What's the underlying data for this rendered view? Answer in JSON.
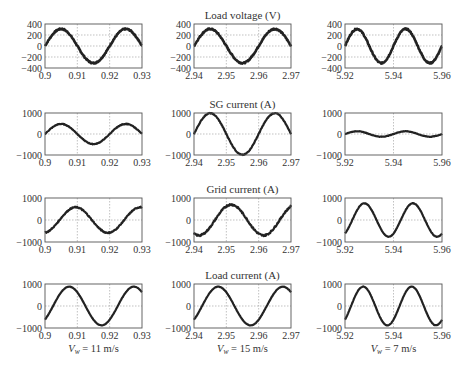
{
  "chart_data": {
    "type": "line",
    "layout": "4x3 grid of subplots",
    "grid": true,
    "columns": [
      {
        "caption_var": "V",
        "caption_sub": "w",
        "caption_value": "= 11 m/s",
        "xlim": [
          0.9,
          0.93
        ],
        "xticks": [
          "0.9",
          "0.91",
          "0.92",
          "0.93"
        ]
      },
      {
        "caption_var": "V",
        "caption_sub": "w",
        "caption_value": "= 15 m/s",
        "xlim": [
          2.94,
          2.97
        ],
        "xticks": [
          "2.94",
          "2.95",
          "2.96",
          "2.97"
        ]
      },
      {
        "caption_var": "V",
        "caption_sub": "w",
        "caption_value": "= 7 m/s",
        "xlim": [
          5.92,
          5.96
        ],
        "xticks": [
          "5.92",
          "5.94",
          "5.96"
        ]
      }
    ],
    "rows": [
      {
        "title": "Load voltage (V)",
        "ylim": [
          -400,
          400
        ],
        "yticks": [
          "400",
          "200",
          "0",
          "−200",
          "−400"
        ]
      },
      {
        "title": "SG current (A)",
        "ylim": [
          -1000,
          1000
        ],
        "yticks": [
          "1000",
          "0",
          "−1000"
        ]
      },
      {
        "title": "Grid current (A)",
        "ylim": [
          -1000,
          1000
        ],
        "yticks": [
          "1000",
          "0",
          "−1000"
        ]
      },
      {
        "title": "Load current (A)",
        "ylim": [
          -1000,
          1000
        ],
        "yticks": [
          "1000",
          "0",
          "−1000"
        ]
      }
    ],
    "series": [
      {
        "row": 0,
        "col": 0,
        "name": "Load voltage, Vw=11",
        "frequency_hz": 50,
        "amplitude": 310,
        "peak_time": 0.905,
        "noise": 12
      },
      {
        "row": 0,
        "col": 1,
        "name": "Load voltage, Vw=15",
        "frequency_hz": 50,
        "amplitude": 310,
        "peak_time": 2.945,
        "noise": 12
      },
      {
        "row": 0,
        "col": 2,
        "name": "Load voltage, Vw=7",
        "frequency_hz": 50,
        "amplitude": 310,
        "peak_time": 5.925,
        "noise": 12
      },
      {
        "row": 1,
        "col": 0,
        "name": "SG current, Vw=11",
        "frequency_hz": 50,
        "amplitude": 480,
        "peak_time": 0.905,
        "noise": 15
      },
      {
        "row": 1,
        "col": 1,
        "name": "SG current, Vw=15",
        "frequency_hz": 50,
        "amplitude": 990,
        "peak_time": 2.945,
        "noise": 20
      },
      {
        "row": 1,
        "col": 2,
        "name": "SG current, Vw=7",
        "frequency_hz": 50,
        "amplitude": 130,
        "peak_time": 5.925,
        "noise": 10
      },
      {
        "row": 2,
        "col": 0,
        "name": "Grid current, Vw=11",
        "frequency_hz": 50,
        "amplitude": 580,
        "peak_time": 0.9095,
        "noise": 25
      },
      {
        "row": 2,
        "col": 1,
        "name": "Grid current, Vw=15",
        "frequency_hz": 50,
        "amplitude": 700,
        "peak_time": 2.9515,
        "noise": 40
      },
      {
        "row": 2,
        "col": 2,
        "name": "Grid current, Vw=7",
        "frequency_hz": 50,
        "amplitude": 760,
        "peak_time": 5.928,
        "noise": 10
      },
      {
        "row": 3,
        "col": 0,
        "name": "Load current, Vw=11",
        "frequency_hz": 50,
        "amplitude": 880,
        "peak_time": 0.9075,
        "noise": 8
      },
      {
        "row": 3,
        "col": 1,
        "name": "Load current, Vw=15",
        "frequency_hz": 50,
        "amplitude": 880,
        "peak_time": 2.9475,
        "noise": 8
      },
      {
        "row": 3,
        "col": 2,
        "name": "Load current, Vw=7",
        "frequency_hz": 50,
        "amplitude": 880,
        "peak_time": 5.9275,
        "noise": 8
      }
    ],
    "colors": {
      "line": "#222222",
      "axes": "#555555",
      "grid": "#999999"
    }
  }
}
